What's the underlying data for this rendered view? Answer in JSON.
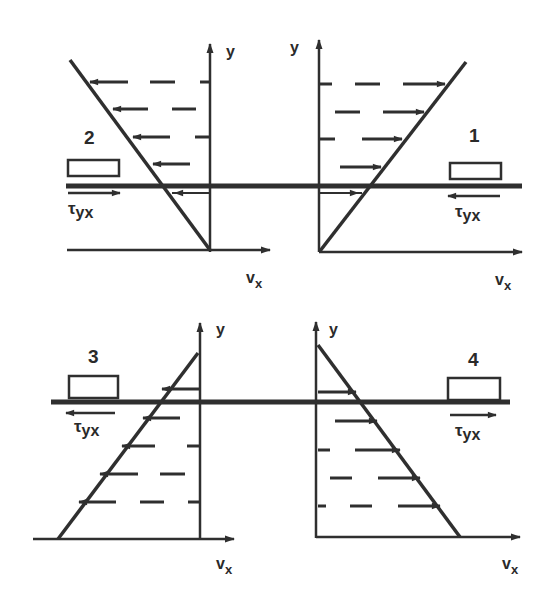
{
  "figure": {
    "stroke_color": "#2f2f2f",
    "background": "#ffffff"
  },
  "panels": [
    {
      "id": "1",
      "label": "1",
      "y_axis_label": "y",
      "x_axis_label": "v",
      "x_axis_sub": "x",
      "stress_symbol": "τ",
      "stress_sub": "yx",
      "velocity_arrow_direction": "right",
      "stress_arrow_direction": "left",
      "profile": "increasing with y, zero at bottom wall"
    },
    {
      "id": "2",
      "label": "2",
      "y_axis_label": "y",
      "x_axis_label": "v",
      "x_axis_sub": "x",
      "stress_symbol": "τ",
      "stress_sub": "yx",
      "velocity_arrow_direction": "left",
      "stress_arrow_direction": "right",
      "profile": "negative, magnitude increasing with y, zero at bottom wall"
    },
    {
      "id": "3",
      "label": "3",
      "y_axis_label": "y",
      "x_axis_label": "v",
      "x_axis_sub": "x",
      "stress_symbol": "τ",
      "stress_sub": "yx",
      "velocity_arrow_direction": "left",
      "stress_arrow_direction": "left",
      "profile": "negative, magnitude decreasing with y, zero at top"
    },
    {
      "id": "4",
      "label": "4",
      "y_axis_label": "y",
      "x_axis_label": "v",
      "x_axis_sub": "x",
      "stress_symbol": "τ",
      "stress_sub": "yx",
      "velocity_arrow_direction": "right",
      "stress_arrow_direction": "right",
      "profile": "positive, magnitude decreasing with y, zero at top"
    }
  ]
}
